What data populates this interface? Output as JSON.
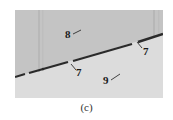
{
  "figure": {
    "caption": "(c)",
    "colors": {
      "upper_phase": "#c4c4c4",
      "lower_phase": "#dcdcdc",
      "boundary_line": "#2a2a2a",
      "label_text": "#1a1a1a"
    },
    "labels": [
      {
        "id": "label-8",
        "text": "8"
      },
      {
        "id": "label-7-left",
        "text": "7"
      },
      {
        "id": "label-7-right",
        "text": "7"
      },
      {
        "id": "label-9",
        "text": "9"
      }
    ]
  }
}
